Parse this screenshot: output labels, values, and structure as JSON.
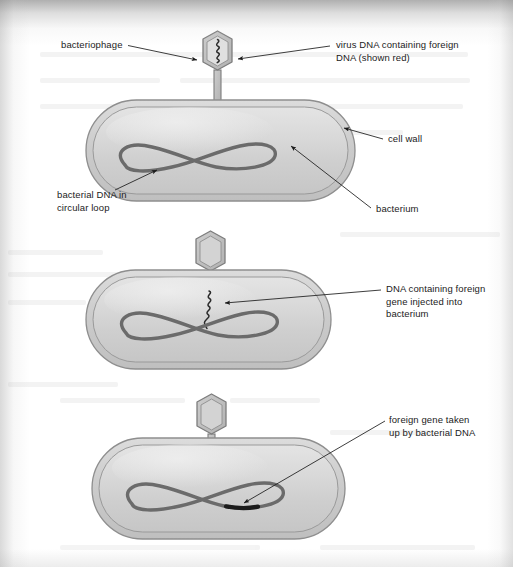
{
  "diagram": {
    "colors": {
      "page_background": "#ffffff",
      "cell_body_fill": "#d6d6d6",
      "cell_wall_fill": "#c3c3c3",
      "cell_outline": "#8e8e8e",
      "dna_loop": "#6b6b6b",
      "phage_fill": "#bcbcbc",
      "phage_outline": "#7d7d7d",
      "phage_dna": "#2b2b2b",
      "foreign_gene": "#1c1c1c",
      "leader_line": "#1b1b1b",
      "label_text": "#1b1b1b"
    },
    "stages": [
      {
        "id": "stage-1",
        "caption": "phage attached to bacterium, virus DNA still inside head",
        "phage_head_state": "full",
        "dna_loop_state": "plain",
        "injected_dna_visible": false
      },
      {
        "id": "stage-2",
        "caption": "phage DNA injected into bacterium",
        "phage_head_state": "empty",
        "dna_loop_state": "plain",
        "injected_dna_visible": true
      },
      {
        "id": "stage-3",
        "caption": "foreign gene incorporated into bacterial DNA loop",
        "phage_head_state": "empty",
        "dna_loop_state": "with-foreign-gene",
        "injected_dna_visible": false
      }
    ],
    "labels": [
      {
        "id": "bacteriophage",
        "text": "bacteriophage"
      },
      {
        "id": "virus-dna",
        "text": "virus DNA containing foreign\nDNA (shown red)"
      },
      {
        "id": "cell-wall",
        "text": "cell wall"
      },
      {
        "id": "bacterial-dna",
        "text": "bacterial DNA in\ncircular loop"
      },
      {
        "id": "bacterium",
        "text": "bacterium"
      },
      {
        "id": "dna-injected",
        "text": "DNA containing foreign\ngene injected into\nbacterium"
      },
      {
        "id": "foreign-gene-taken",
        "text": "foreign gene taken\nup by bacterial DNA"
      }
    ]
  }
}
